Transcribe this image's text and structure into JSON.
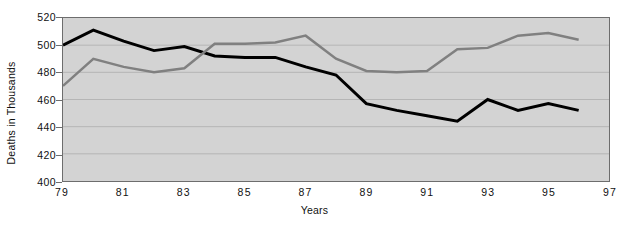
{
  "chart_data": {
    "type": "line",
    "title": "",
    "xlabel": "Years",
    "ylabel": "Deaths in Thousands",
    "x": [
      79,
      80,
      81,
      82,
      83,
      84,
      85,
      86,
      87,
      88,
      89,
      90,
      91,
      92,
      93,
      94,
      95,
      96
    ],
    "xlim": [
      79,
      97
    ],
    "ylim": [
      400,
      520
    ],
    "yticks": [
      400,
      420,
      440,
      460,
      480,
      500,
      520
    ],
    "xticks": [
      79,
      81,
      83,
      85,
      87,
      89,
      91,
      93,
      95,
      97
    ],
    "xtick_labels": [
      "79",
      "81",
      "83",
      "85",
      "87",
      "89",
      "91",
      "93",
      "95",
      "97"
    ],
    "ytick_labels": [
      "400",
      "420",
      "440",
      "460",
      "480",
      "500",
      "520"
    ],
    "grid": true,
    "grid_axis": "y",
    "legend": false,
    "plot_background": "#d3d3d3",
    "series": [
      {
        "name": "series-black",
        "color": "#000000",
        "width": 3,
        "values": [
          500,
          511,
          503,
          496,
          499,
          492,
          491,
          491,
          484,
          478,
          457,
          452,
          448,
          444,
          460,
          452,
          457,
          452
        ]
      },
      {
        "name": "series-gray",
        "color": "#808080",
        "width": 2.5,
        "values": [
          470,
          490,
          484,
          480,
          483,
          501,
          501,
          502,
          507,
          490,
          481,
          480,
          481,
          497,
          498,
          507,
          509,
          504
        ]
      }
    ]
  }
}
